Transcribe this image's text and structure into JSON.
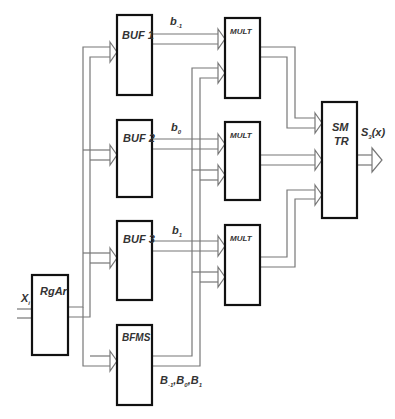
{
  "blocks": {
    "rgar": "RgAr",
    "buf1": "BUF 1",
    "buf2": "BUF 2",
    "buf3": "BUF 3",
    "bfms": "BFMS",
    "mult1": "MULT",
    "mult2": "MULT",
    "mult3": "MULT",
    "smtr_line1": "SM",
    "smtr_line2": "TR"
  },
  "signals": {
    "input": {
      "base": "X",
      "sub": "i"
    },
    "b_minus1": {
      "base": "b",
      "sub": "-1"
    },
    "b_0": {
      "base": "b",
      "sub": "0"
    },
    "b_1": {
      "base": "b",
      "sub": "1"
    },
    "bfms_out": [
      {
        "base": "B",
        "sub": "-1"
      },
      {
        "base": "B",
        "sub": "0"
      },
      {
        "base": "B",
        "sub": "1"
      }
    ],
    "bfms_sep": ",",
    "output": {
      "base": "S",
      "sub": "3",
      "suffix": "(x)"
    }
  },
  "colors": {
    "block_border": "#111111",
    "bus": "#777777",
    "text": "#333333"
  }
}
